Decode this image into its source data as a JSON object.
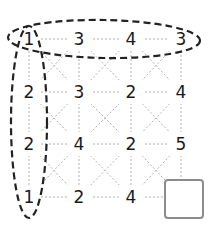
{
  "puzzle": {
    "grid": [
      [
        "1",
        "3",
        "4",
        "3"
      ],
      [
        "2",
        "3",
        "2",
        "4"
      ],
      [
        "2",
        "4",
        "2",
        "5"
      ],
      [
        "1",
        "2",
        "4",
        ""
      ]
    ],
    "highlighted_row_label": "top row",
    "highlighted_column_label": "left column",
    "missing_cell": {
      "row": 3,
      "col": 3
    }
  },
  "colors": {
    "text": "#1a1a1a",
    "grid_line": "#b0b0b0",
    "ellipse": "#222222",
    "answer_border": "#8c8c8c"
  }
}
